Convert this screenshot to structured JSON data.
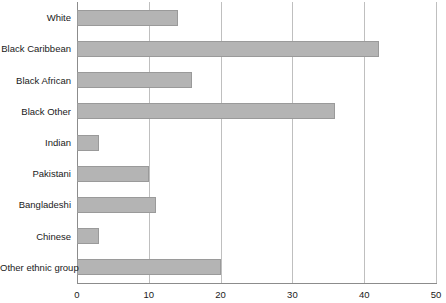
{
  "chart_data": {
    "type": "bar",
    "orientation": "horizontal",
    "title": "",
    "subtitle": "",
    "xlabel": "",
    "ylabel": "",
    "categories": [
      "White",
      "Black Caribbean",
      "Black African",
      "Black Other",
      "Indian",
      "Pakistani",
      "Bangladeshi",
      "Chinese",
      "Other ethnic group"
    ],
    "values": [
      14,
      42,
      16,
      36,
      3,
      10,
      11,
      3,
      20
    ],
    "xlim": [
      0,
      50
    ],
    "xticks": [
      0,
      10,
      20,
      30,
      40,
      50
    ],
    "xtick_labels": [
      "0",
      "10",
      "20",
      "30",
      "40",
      "50"
    ],
    "grid": "vertical",
    "legend": null,
    "bar_color": "#b4b4b4",
    "bar_border_color": "#9a9a9a",
    "gridline_color": "#bfbfbf",
    "axis_color": "#8c8c8c",
    "text_color": "#1a1a1a"
  }
}
